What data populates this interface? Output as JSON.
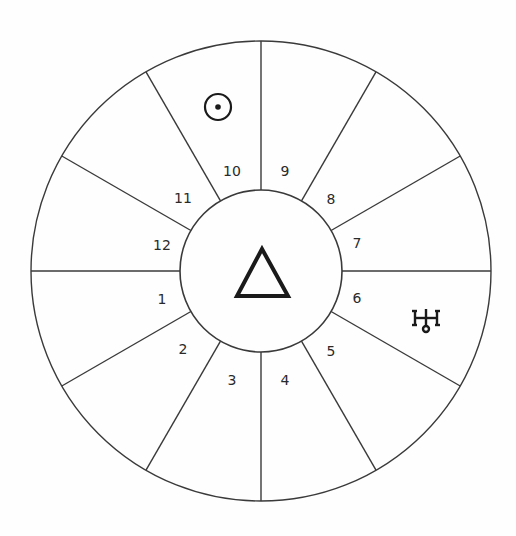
{
  "chart": {
    "center_symbol": "triangle",
    "center_symbol_name": "fire-element-triangle",
    "houses": [
      {
        "number": "1",
        "x": 162,
        "y": 299
      },
      {
        "number": "2",
        "x": 183,
        "y": 349
      },
      {
        "number": "3",
        "x": 232,
        "y": 380
      },
      {
        "number": "4",
        "x": 285,
        "y": 380
      },
      {
        "number": "5",
        "x": 331,
        "y": 351
      },
      {
        "number": "6",
        "x": 357,
        "y": 298
      },
      {
        "number": "7",
        "x": 357,
        "y": 243
      },
      {
        "number": "8",
        "x": 331,
        "y": 199
      },
      {
        "number": "9",
        "x": 285,
        "y": 171
      },
      {
        "number": "10",
        "x": 232,
        "y": 171
      },
      {
        "number": "11",
        "x": 183,
        "y": 198
      },
      {
        "number": "12",
        "x": 162,
        "y": 245
      }
    ],
    "planets": [
      {
        "name": "sun",
        "glyph": "☉",
        "house": "10"
      },
      {
        "name": "uranus",
        "glyph": "♅",
        "house": "6"
      }
    ],
    "colors": {
      "line": "#3a3a3a",
      "symbol": "#1a1a1a",
      "background": "#fefefe"
    }
  }
}
